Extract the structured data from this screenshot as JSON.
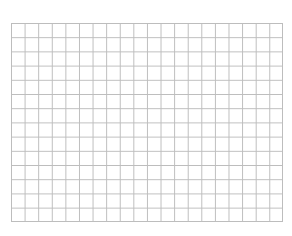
{
  "grid": {
    "columns": 20,
    "rows": 14,
    "line_color": "#bdbdbd",
    "background_color": "#ffffff"
  }
}
